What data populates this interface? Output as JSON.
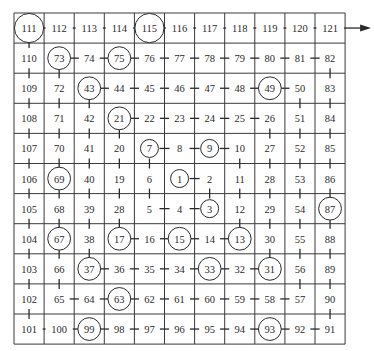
{
  "diagram": {
    "type": "number-spiral",
    "grid": {
      "cols": 11,
      "rows": 11,
      "left": 14,
      "top": 13,
      "cell": 30.1
    },
    "rows": [
      [
        111,
        112,
        113,
        114,
        115,
        116,
        117,
        118,
        119,
        120,
        121
      ],
      [
        110,
        73,
        74,
        75,
        76,
        77,
        78,
        79,
        80,
        81,
        82
      ],
      [
        109,
        72,
        43,
        44,
        45,
        46,
        47,
        48,
        49,
        50,
        83
      ],
      [
        108,
        71,
        42,
        21,
        22,
        23,
        24,
        25,
        26,
        51,
        84
      ],
      [
        107,
        70,
        41,
        20,
        7,
        8,
        9,
        10,
        27,
        52,
        85
      ],
      [
        106,
        69,
        40,
        19,
        6,
        1,
        2,
        11,
        28,
        53,
        86
      ],
      [
        105,
        68,
        39,
        28,
        5,
        4,
        3,
        12,
        29,
        54,
        87
      ],
      [
        104,
        67,
        38,
        17,
        16,
        15,
        14,
        13,
        30,
        55,
        88
      ],
      [
        103,
        66,
        37,
        36,
        35,
        34,
        33,
        32,
        31,
        56,
        89
      ],
      [
        102,
        65,
        64,
        63,
        62,
        61,
        60,
        59,
        58,
        57,
        90
      ],
      [
        101,
        100,
        99,
        98,
        97,
        96,
        95,
        94,
        93,
        92,
        91
      ]
    ],
    "circled": [
      1,
      3,
      7,
      9,
      13,
      15,
      17,
      21,
      31,
      33,
      37,
      43,
      49,
      63,
      67,
      69,
      73,
      75,
      87,
      93,
      99,
      111,
      115
    ],
    "path_order": "1-121 spiral",
    "arrow": {
      "from": 121,
      "direction": "right"
    },
    "colors": {
      "line": "#2a2a2a",
      "grid": "#3a3a3a",
      "background": "#ffffff"
    }
  }
}
